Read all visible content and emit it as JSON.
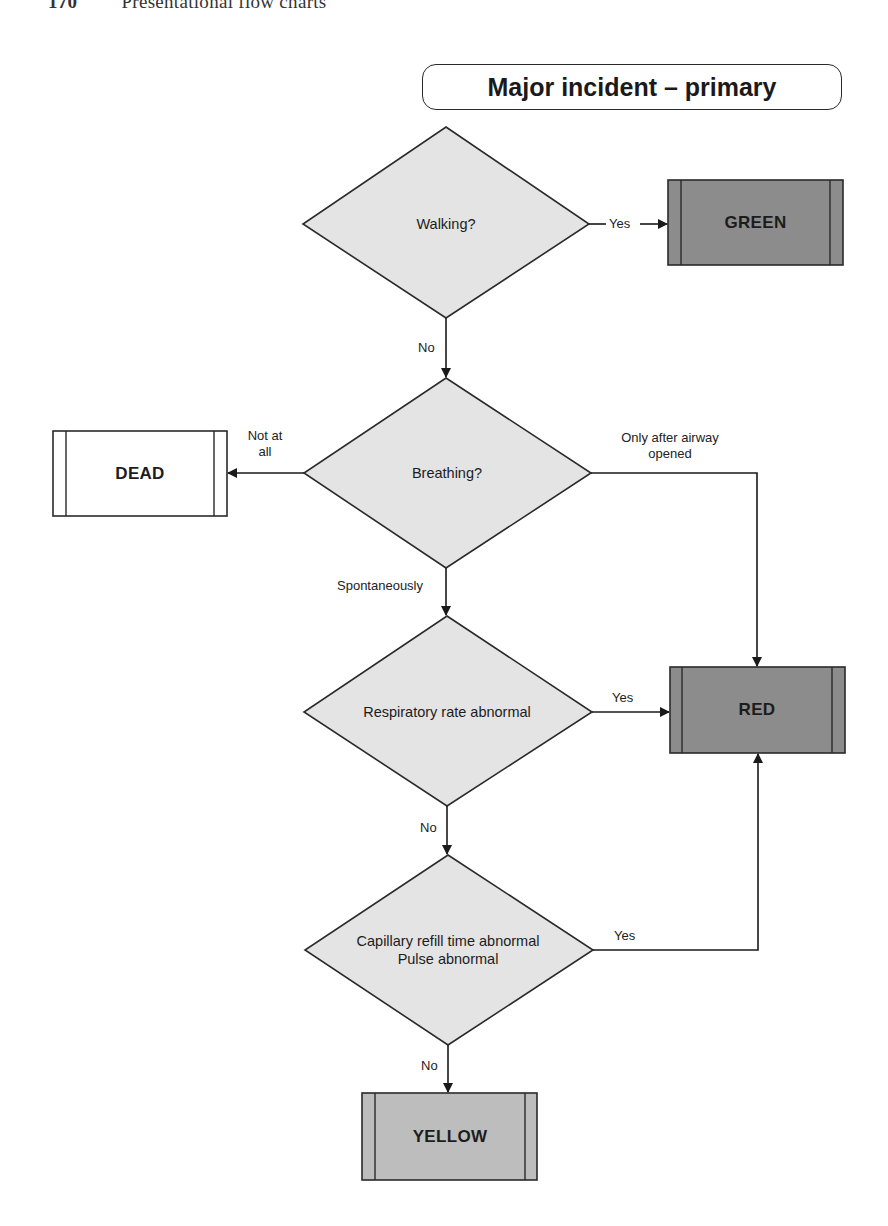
{
  "page": {
    "page_number": "170",
    "running_head": "Presentational flow charts"
  },
  "title": "Major incident – primary",
  "colors": {
    "decision_fill": "#e4e4e4",
    "green_fill": "#8c8c8c",
    "red_fill": "#8c8c8c",
    "yellow_fill": "#bdbdbd",
    "dead_fill": "#ffffff",
    "stroke": "#2a2a2a"
  },
  "decisions": [
    {
      "id": "walking",
      "text": "Walking?"
    },
    {
      "id": "breathing",
      "text": "Breathing?"
    },
    {
      "id": "respiratory",
      "text": "Respiratory rate abnormal"
    },
    {
      "id": "capillary",
      "line1": "Capillary refill time abnormal",
      "line2": "Pulse abnormal"
    }
  ],
  "outcomes": [
    {
      "id": "green",
      "text": "GREEN"
    },
    {
      "id": "dead",
      "text": "DEAD"
    },
    {
      "id": "red",
      "text": "RED"
    },
    {
      "id": "yellow",
      "text": "YELLOW"
    }
  ],
  "edges": [
    {
      "from": "walking",
      "to": "green",
      "label": "Yes"
    },
    {
      "from": "walking",
      "to": "breathing",
      "label": "No"
    },
    {
      "from": "breathing",
      "to": "dead",
      "label_line1": "Not at",
      "label_line2": "all"
    },
    {
      "from": "breathing",
      "to": "red",
      "label_line1": "Only after airway",
      "label_line2": "opened"
    },
    {
      "from": "breathing",
      "to": "respiratory",
      "label": "Spontaneously"
    },
    {
      "from": "respiratory",
      "to": "red",
      "label": "Yes"
    },
    {
      "from": "respiratory",
      "to": "capillary",
      "label": "No"
    },
    {
      "from": "capillary",
      "to": "red",
      "label": "Yes"
    },
    {
      "from": "capillary",
      "to": "yellow",
      "label": "No"
    }
  ]
}
